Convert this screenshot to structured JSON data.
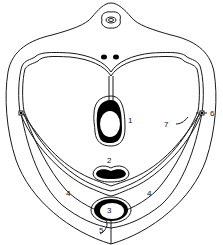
{
  "diagram": {
    "type": "anatomical cross-section",
    "colors": {
      "stroke": "#1a1a1a",
      "fill_dark": "#000000",
      "background": "#ffffff"
    },
    "labels": [
      {
        "id": "1",
        "text": "1"
      },
      {
        "id": "2",
        "text": "2"
      },
      {
        "id": "3",
        "text": "3"
      },
      {
        "id": "4a",
        "text": "4"
      },
      {
        "id": "4b",
        "text": "4"
      },
      {
        "id": "5",
        "text": "5"
      },
      {
        "id": "6",
        "text": "6"
      },
      {
        "id": "7",
        "text": "7"
      }
    ]
  }
}
